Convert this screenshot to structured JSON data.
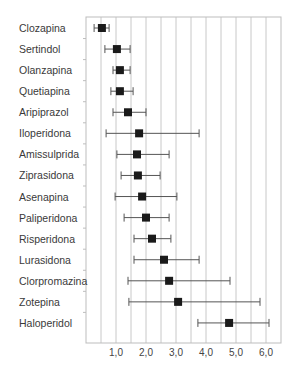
{
  "chart_data": {
    "type": "forest",
    "title": "",
    "xlabel": "",
    "ylabel": "",
    "xlim": [
      0,
      6.5
    ],
    "xticks": [
      1.0,
      2.0,
      3.0,
      4.0,
      5.0,
      6.0
    ],
    "xtick_labels": [
      "1,0",
      "2,0",
      "3,0",
      "4,0",
      "5,0",
      "6,0"
    ],
    "grid": {
      "vertical": true,
      "step": 0.5
    },
    "legend": null,
    "categories": [
      "Clozapina",
      "Sertindol",
      "Olanzapina",
      "Quetiapina",
      "Aripiprazol",
      "Iloperidona",
      "Amissulprida",
      "Ziprasidona",
      "Asenapina",
      "Paliperidona",
      "Risperidona",
      "Lurasidona",
      "Clorpromazina",
      "Zotepina",
      "Haloperidol"
    ],
    "series": [
      {
        "name": "estimate",
        "values": [
          0.53,
          1.03,
          1.13,
          1.13,
          1.4,
          1.77,
          1.7,
          1.73,
          1.87,
          2.0,
          2.2,
          2.6,
          2.77,
          3.07,
          4.77
        ],
        "ci_low": [
          0.27,
          0.63,
          0.9,
          0.83,
          0.9,
          0.67,
          1.03,
          1.17,
          0.97,
          1.27,
          1.6,
          1.6,
          1.4,
          1.43,
          3.73
        ],
        "ci_high": [
          0.77,
          1.47,
          1.47,
          1.57,
          2.0,
          3.77,
          2.77,
          2.47,
          3.03,
          2.77,
          2.83,
          3.77,
          4.8,
          5.8,
          6.1
        ]
      }
    ]
  },
  "style": {
    "marker_color": "#1a1a1a",
    "ci_color": "#555555",
    "grid_color": "#c8c8c8",
    "axis_color": "#bdbdbd"
  }
}
